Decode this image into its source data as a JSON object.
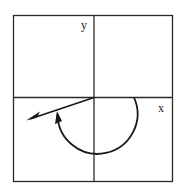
{
  "diagram": {
    "type": "angle-in-standard-position",
    "axes": {
      "x_label": "x",
      "y_label": "y"
    },
    "angle": {
      "direction": "clockwise",
      "initial_side": "positive x-axis",
      "terminal_quadrant": "III",
      "approx_degrees": -200
    },
    "colors": {
      "line": "#2a2a2a",
      "background": "#ffffff"
    }
  }
}
